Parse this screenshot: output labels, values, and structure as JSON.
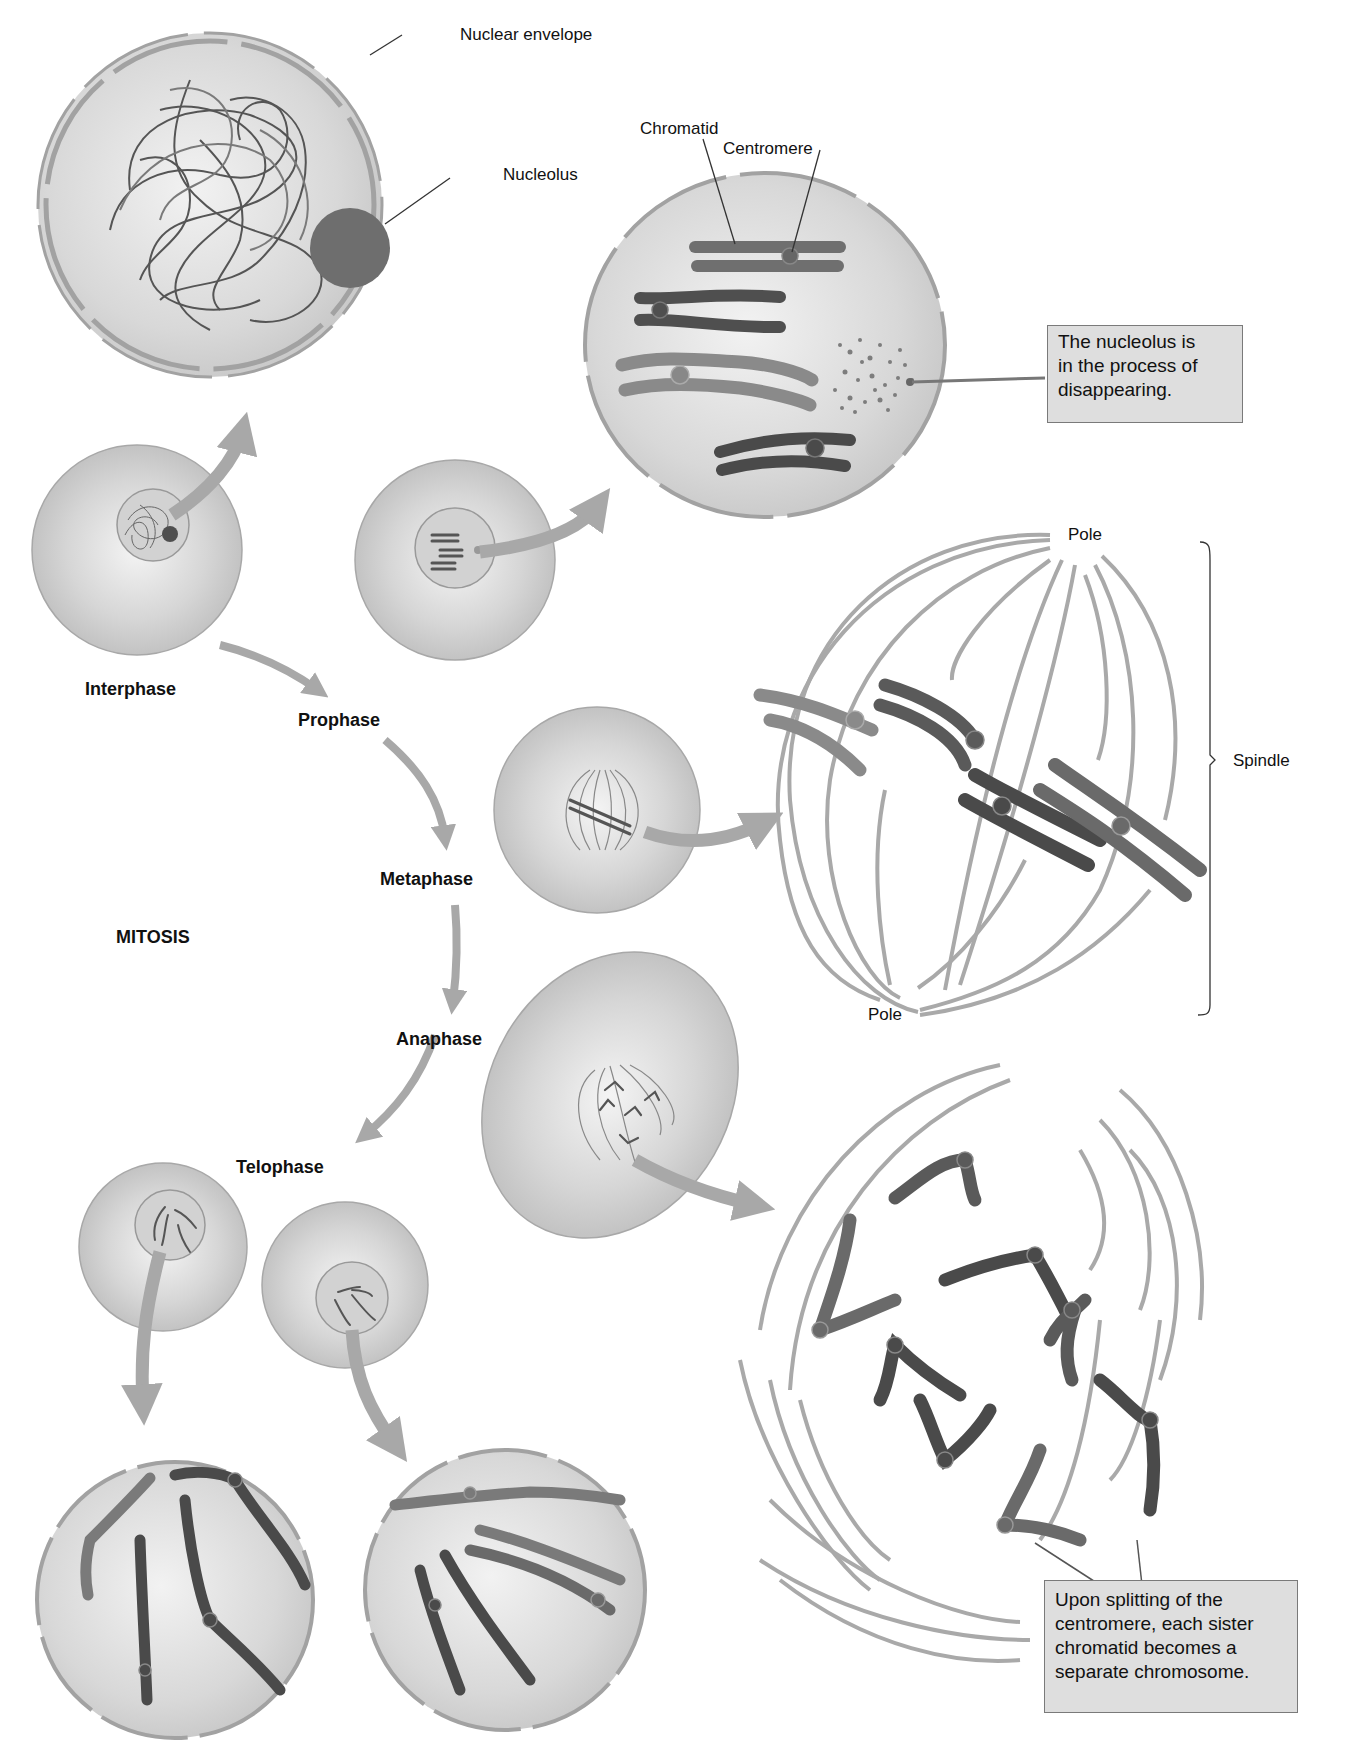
{
  "title": "MITOSIS",
  "phases": [
    {
      "name": "Interphase"
    },
    {
      "name": "Prophase"
    },
    {
      "name": "Metaphase"
    },
    {
      "name": "Anaphase"
    },
    {
      "name": "Telophase"
    }
  ],
  "labels": {
    "nuclear_envelope": "Nuclear envelope",
    "nucleolus": "Nucleolus",
    "chromatid": "Chromatid",
    "centromere": "Centromere",
    "pole_top": "Pole",
    "pole_bottom": "Pole",
    "spindle": "Spindle"
  },
  "callouts": {
    "nucleolus_disappearing": [
      "The nucleolus is",
      "in the process of",
      "disappearing."
    ],
    "centromere_splitting": [
      "Upon splitting of the",
      "centromere, each sister",
      "chromatid becomes a",
      "separate chromosome."
    ]
  },
  "colors": {
    "cell_fill": "#c8c8c8",
    "cell_edge": "#9a9a9a",
    "arrow": "#a8a8a8",
    "chromosome_dark": "#5a5a5a",
    "chromosome_mid": "#7c7c7c",
    "spindle": "#a9a9a9",
    "callout_bg": "#dedede"
  }
}
